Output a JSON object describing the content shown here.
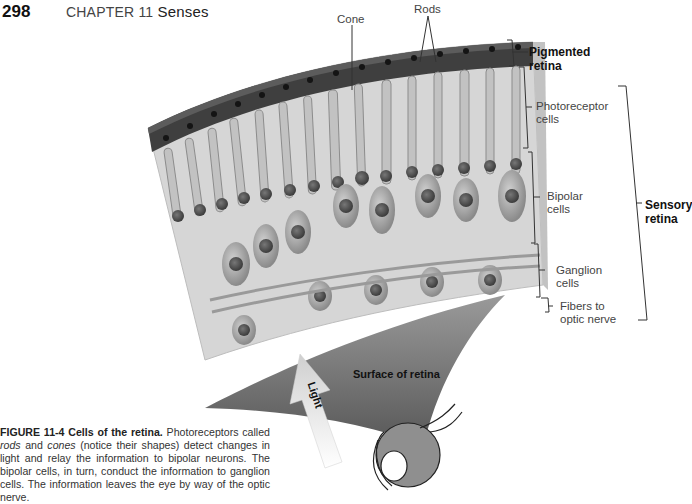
{
  "header": {
    "page_number": "298",
    "chapter_label": "CHAPTER 11",
    "chapter_title": "Senses"
  },
  "figure": {
    "top_labels": {
      "cone": "Cone",
      "rods": "Rods"
    },
    "layer_labels": [
      {
        "id": "pigmented",
        "line1": "Pigmented",
        "line2": "retina",
        "bold": true
      },
      {
        "id": "photoreceptor",
        "line1": "Photoreceptor",
        "line2": "cells",
        "bold": false
      },
      {
        "id": "bipolar",
        "line1": "Bipolar",
        "line2": "cells",
        "bold": false
      },
      {
        "id": "ganglion",
        "line1": "Ganglion",
        "line2": "cells",
        "bold": false
      },
      {
        "id": "fibers",
        "line1": "Fibers to",
        "line2": "optic nerve",
        "bold": false
      }
    ],
    "group_label": {
      "line1": "Sensory",
      "line2": "retina"
    },
    "surface_label": "Surface of retina",
    "arrow_label": "Light"
  },
  "caption": {
    "figure_id": "FIGURE 11-4",
    "figure_title": "Cells of the retina.",
    "text_1": " Photoreceptors called ",
    "em_1": "rods",
    "text_2": " and ",
    "em_2": "cones",
    "text_3": " (notice their shapes) detect changes in light and relay the information to bipolar neurons. The bipolar cells, in turn, conduct the information to ganglion cells. The information leaves the eye by way of the optic nerve."
  },
  "colors": {
    "background": "#ffffff",
    "pigment_dark": "#3a3a3a",
    "tissue": "#d4d4d4",
    "cell": "#b0b0b0",
    "cone_shadow": "#6e6e6e",
    "arrow": "#d8d8d8"
  }
}
